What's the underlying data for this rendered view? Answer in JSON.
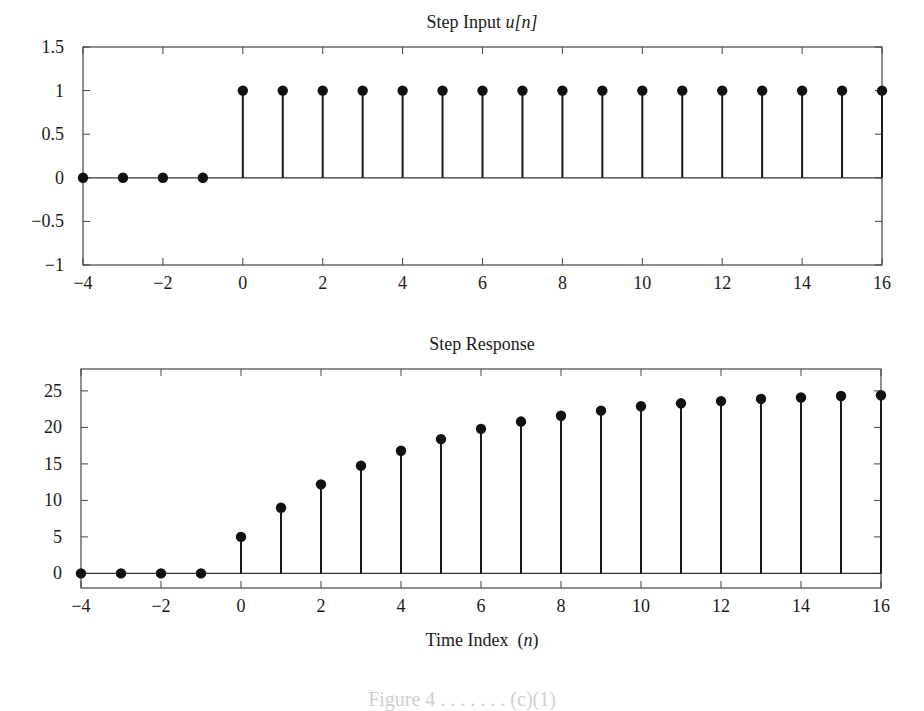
{
  "figure": {
    "xlabel": "Time Index",
    "xlabel_var": "(n)",
    "caption_partial": "Figure 4 . . . . . . . (c)(1)"
  },
  "chart_data": [
    {
      "type": "stem",
      "title": "Step Input",
      "title_var": "u[n]",
      "xlabel": "",
      "ylabel": "",
      "xlim": [
        -4,
        16
      ],
      "ylim": [
        -1,
        1.5
      ],
      "xticks": [
        -4,
        -2,
        0,
        2,
        4,
        6,
        8,
        10,
        12,
        14,
        16
      ],
      "yticks": [
        1.5,
        1,
        0.5,
        0,
        -0.5,
        -1
      ],
      "ytick_labels": [
        "1.5",
        "1",
        "0.5",
        "0",
        "−0.5",
        "−1"
      ],
      "xtick_labels": [
        "−4",
        "−2",
        "0",
        "2",
        "4",
        "6",
        "8",
        "10",
        "12",
        "14",
        "16"
      ],
      "grid": false,
      "x": [
        -4,
        -3,
        -2,
        -1,
        0,
        1,
        2,
        3,
        4,
        5,
        6,
        7,
        8,
        9,
        10,
        11,
        12,
        13,
        14,
        15,
        16
      ],
      "values": [
        0,
        0,
        0,
        0,
        1,
        1,
        1,
        1,
        1,
        1,
        1,
        1,
        1,
        1,
        1,
        1,
        1,
        1,
        1,
        1,
        1
      ]
    },
    {
      "type": "stem",
      "title": "Step Response",
      "title_var": "",
      "xlabel": "Time Index (n)",
      "ylabel": "",
      "xlim": [
        -4,
        16
      ],
      "ylim": [
        -2,
        28
      ],
      "xticks": [
        -4,
        -2,
        0,
        2,
        4,
        6,
        8,
        10,
        12,
        14,
        16
      ],
      "yticks": [
        25,
        20,
        15,
        10,
        5,
        0
      ],
      "ytick_labels": [
        "25",
        "20",
        "15",
        "10",
        "5",
        "0"
      ],
      "xtick_labels": [
        "−4",
        "−2",
        "0",
        "2",
        "4",
        "6",
        "8",
        "10",
        "12",
        "14",
        "16"
      ],
      "grid": false,
      "x": [
        -4,
        -3,
        -2,
        -1,
        0,
        1,
        2,
        3,
        4,
        5,
        6,
        7,
        8,
        9,
        10,
        11,
        12,
        13,
        14,
        15,
        16
      ],
      "values": [
        0,
        0,
        0,
        0,
        5.0,
        9.0,
        12.2,
        14.76,
        16.8,
        18.4,
        19.8,
        20.8,
        21.6,
        22.3,
        22.9,
        23.3,
        23.6,
        23.9,
        24.1,
        24.3,
        24.4
      ]
    }
  ]
}
